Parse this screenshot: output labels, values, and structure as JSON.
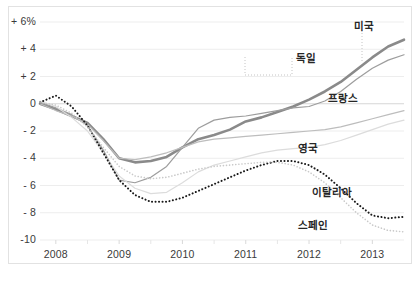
{
  "chart_data": {
    "type": "line",
    "title": "",
    "xlabel": "",
    "ylabel": "",
    "unit": "%",
    "grid": true,
    "legend_position": "inline-labels",
    "xlim": [
      2007.75,
      2013.5
    ],
    "ylim": [
      -10,
      6
    ],
    "yticks": [
      6,
      4,
      2,
      0,
      -2,
      -4,
      -6,
      -8,
      -10
    ],
    "ytick_labels": [
      "+ 6%",
      "+ 4",
      "+ 2",
      "0",
      "- 2",
      "- 4",
      "- 6",
      "- 8",
      "-10"
    ],
    "xticks": [
      2008,
      2009,
      2010,
      2011,
      2012,
      2013
    ],
    "xtick_labels": [
      "2008",
      "2009",
      "2010",
      "2011",
      "2012",
      "2013"
    ],
    "x": [
      2007.75,
      2008.0,
      2008.25,
      2008.5,
      2008.75,
      2009.0,
      2009.25,
      2009.5,
      2009.75,
      2010.0,
      2010.25,
      2010.5,
      2010.75,
      2011.0,
      2011.25,
      2011.5,
      2011.75,
      2012.0,
      2012.25,
      2012.5,
      2012.75,
      2013.0,
      2013.25,
      2013.5
    ],
    "series": [
      {
        "name": "미국",
        "name_en": "USA",
        "style": "solid",
        "color": "#8a8a8a",
        "width": 2.6,
        "values": [
          0.0,
          -0.4,
          -0.9,
          -1.4,
          -2.6,
          -4.0,
          -4.3,
          -4.2,
          -3.9,
          -3.2,
          -2.6,
          -2.3,
          -1.9,
          -1.3,
          -1.0,
          -0.6,
          -0.2,
          0.3,
          0.9,
          1.6,
          2.5,
          3.4,
          4.2,
          4.7
        ]
      },
      {
        "name": "독일",
        "name_en": "Germany",
        "style": "solid",
        "color": "#9d9d9d",
        "width": 1.2,
        "values": [
          0.1,
          -0.3,
          -0.8,
          -1.6,
          -3.4,
          -5.6,
          -5.8,
          -5.4,
          -4.6,
          -3.2,
          -1.8,
          -1.2,
          -1.0,
          -0.9,
          -0.7,
          -0.5,
          -0.3,
          -0.2,
          0.2,
          0.9,
          1.8,
          2.6,
          3.2,
          3.6
        ]
      },
      {
        "name": "프랑스",
        "name_en": "France",
        "style": "solid",
        "color": "#bdbdbd",
        "width": 1.2,
        "values": [
          0.0,
          -0.5,
          -0.9,
          -1.5,
          -2.7,
          -4.0,
          -4.1,
          -3.9,
          -3.6,
          -3.2,
          -2.8,
          -2.6,
          -2.5,
          -2.4,
          -2.3,
          -2.2,
          -2.1,
          -2.0,
          -1.9,
          -1.7,
          -1.4,
          -1.1,
          -0.8,
          -0.5
        ]
      },
      {
        "name": "영국",
        "name_en": "United Kingdom",
        "style": "solid",
        "color": "#dcdcdc",
        "width": 1.2,
        "values": [
          0.2,
          -0.2,
          -1.0,
          -2.0,
          -3.6,
          -5.3,
          -6.2,
          -6.6,
          -6.5,
          -5.8,
          -5.0,
          -4.5,
          -4.2,
          -3.9,
          -3.6,
          -3.4,
          -3.3,
          -3.2,
          -3.0,
          -2.7,
          -2.3,
          -1.9,
          -1.5,
          -1.2
        ]
      },
      {
        "name": "이탈리아",
        "name_en": "Italy",
        "style": "dotted-heavy",
        "color": "#1a1a1a",
        "width": 2.0,
        "values": [
          0.1,
          0.6,
          -0.2,
          -1.6,
          -3.6,
          -5.6,
          -6.7,
          -7.2,
          -7.2,
          -6.9,
          -6.4,
          -5.9,
          -5.4,
          -4.9,
          -4.5,
          -4.2,
          -4.2,
          -4.5,
          -5.2,
          -6.2,
          -7.3,
          -8.2,
          -8.4,
          -8.3
        ]
      },
      {
        "name": "스페인",
        "name_en": "Spain",
        "style": "dotted-light",
        "color": "#c9c9c9",
        "width": 1.6,
        "values": [
          0.1,
          -0.1,
          -0.7,
          -1.7,
          -3.2,
          -4.6,
          -5.3,
          -5.5,
          -5.4,
          -5.1,
          -4.8,
          -4.6,
          -4.5,
          -4.4,
          -4.3,
          -4.3,
          -4.5,
          -5.0,
          -5.8,
          -6.9,
          -8.0,
          -8.9,
          -9.3,
          -9.4
        ]
      }
    ],
    "annotations": [
      {
        "label": "미국",
        "label_en": "USA",
        "x_px": 354,
        "y_px": 18,
        "leader": {
          "x1": 362,
          "y1": 30,
          "x2": 362,
          "y2": 62
        }
      },
      {
        "label": "독일",
        "label_en": "Germany",
        "x_px": 296,
        "y_px": 50,
        "leader": {
          "x1": 293,
          "y1": 57,
          "x2": 293,
          "y2": 57
        }
      },
      {
        "label": "프랑스",
        "label_en": "France",
        "x_px": 328,
        "y_px": 90,
        "leader": null
      },
      {
        "label": "영국",
        "label_en": "United Kingdom",
        "x_px": 298,
        "y_px": 140,
        "leader": null
      },
      {
        "label": "이탈리아",
        "label_en": "Italy",
        "x_px": 312,
        "y_px": 184,
        "leader": null
      },
      {
        "label": "스페인",
        "label_en": "Spain",
        "x_px": 298,
        "y_px": 217,
        "leader": null
      }
    ]
  },
  "source": {
    "text": ""
  }
}
